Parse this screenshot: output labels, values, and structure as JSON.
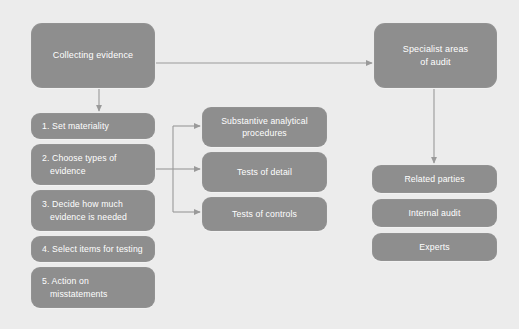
{
  "diagram": {
    "background_color": "#ececec",
    "node_color": "#8e8e8e",
    "text_color": "#ffffff",
    "connector_color": "#8e8e8e"
  },
  "nodes": {
    "collecting_evidence": "Collecting evidence",
    "specialist_areas": "Specialist areas\nof audit",
    "steps": [
      {
        "number": "1.",
        "text": "Set materiality"
      },
      {
        "number": "2.",
        "text": "Choose types of",
        "cont": "evidence"
      },
      {
        "number": "3.",
        "text": "Decide how much",
        "cont": "evidence is needed"
      },
      {
        "number": "4.",
        "text": "Select items for testing"
      },
      {
        "number": "5.",
        "text": "Action on",
        "cont": "misstatements"
      }
    ],
    "evidence_types": [
      "Substantive analytical\nprocedures",
      "Tests of detail",
      "Tests of controls"
    ],
    "specialist_items": [
      "Related parties",
      "Internal audit",
      "Experts"
    ]
  }
}
